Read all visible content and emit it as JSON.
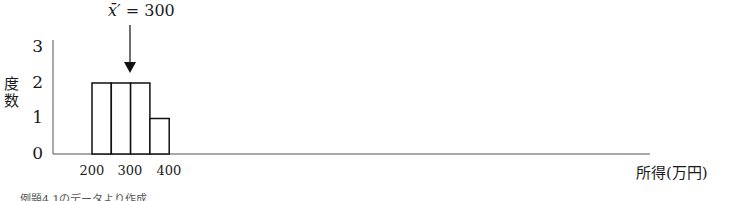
{
  "chart_data": {
    "type": "bar",
    "title": "",
    "categories": [
      "200-250",
      "250-300",
      "300-350",
      "350-400"
    ],
    "values": [
      2,
      2,
      2,
      1
    ],
    "xlabel": "所得(万円)",
    "ylabel": "度数",
    "x_ticks": [
      "200",
      "300",
      "400"
    ],
    "y_ticks": [
      "0",
      "1",
      "2",
      "3"
    ],
    "ylim": [
      0,
      3
    ],
    "grid": false,
    "annotation": {
      "text": "x̄′ = 300",
      "points_to": 300
    },
    "caption": "例題4.1のデータより作成"
  },
  "labels": {
    "ylabel_top": "度",
    "ylabel_bottom": "数",
    "annot_var": "x̄′",
    "annot_eq": " = 300"
  }
}
